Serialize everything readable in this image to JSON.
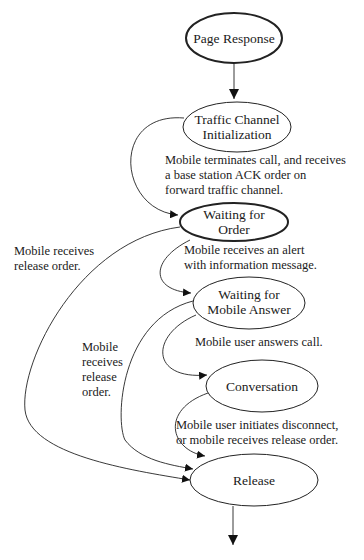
{
  "diagram": {
    "type": "state-diagram",
    "nodes": [
      {
        "id": "page_response",
        "lines": [
          "Page Response"
        ]
      },
      {
        "id": "traffic_init",
        "lines": [
          "Traffic Channel",
          "Initialization"
        ]
      },
      {
        "id": "waiting_order",
        "lines": [
          "Waiting  for",
          "Order"
        ]
      },
      {
        "id": "waiting_answer",
        "lines": [
          "Waiting  for",
          "Mobile Answer"
        ]
      },
      {
        "id": "conversation",
        "lines": [
          "Conversation"
        ]
      },
      {
        "id": "release",
        "lines": [
          "Release"
        ]
      }
    ],
    "edges": [
      {
        "from": "page_response",
        "to": "traffic_init",
        "label": ""
      },
      {
        "from": "traffic_init",
        "to": "waiting_order",
        "label": "Mobile terminates call, and receives a base station ACK order on forward traffic channel."
      },
      {
        "from": "waiting_order",
        "to": "waiting_answer",
        "label": "Mobile receives an alert with information message."
      },
      {
        "from": "waiting_order",
        "to": "release",
        "label": "Mobile receives release order."
      },
      {
        "from": "waiting_answer",
        "to": "conversation",
        "label": "Mobile user answers call."
      },
      {
        "from": "waiting_answer",
        "to": "release",
        "label": "Mobile receives release order."
      },
      {
        "from": "conversation",
        "to": "release",
        "label": "Mobile user initiates disconnect, or mobile receives release order."
      },
      {
        "from": "release",
        "to": "exit",
        "label": ""
      }
    ],
    "edge_labels": {
      "traffic_to_order": [
        "Mobile terminates call, and receives",
        "a base station ACK order on",
        "forward traffic channel."
      ],
      "order_to_answer": [
        "Mobile receives an alert",
        "with information message."
      ],
      "order_to_release": [
        "Mobile receives",
        "release order."
      ],
      "answer_to_conversation": [
        "Mobile user answers call."
      ],
      "answer_to_release": [
        "Mobile",
        "receives",
        "release",
        "order."
      ],
      "conversation_to_release": [
        "Mobile user initiates disconnect,",
        "or mobile receives release order."
      ]
    }
  }
}
